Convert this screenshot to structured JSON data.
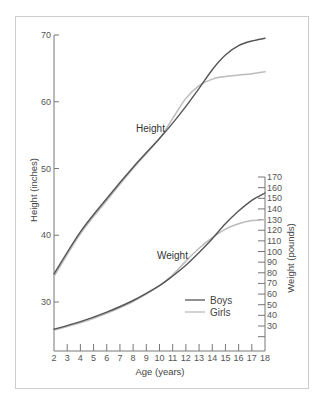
{
  "chart_data": {
    "type": "line",
    "title": "",
    "xlabel": "Age (years)",
    "ylabel_left": "Height (inches)",
    "ylabel_right": "Weight (pounds)",
    "xlim": [
      2,
      18
    ],
    "ylim_left": [
      22,
      70
    ],
    "ylim_right": [
      20,
      170
    ],
    "x_ticks": [
      2,
      3,
      4,
      5,
      6,
      7,
      8,
      9,
      10,
      11,
      12,
      13,
      14,
      15,
      16,
      17,
      18
    ],
    "left_ticks": [
      30,
      40,
      50,
      60,
      70
    ],
    "right_ticks": [
      30,
      40,
      50,
      60,
      70,
      80,
      90,
      100,
      110,
      120,
      130,
      140,
      150,
      160,
      170
    ],
    "right_minor_ticks": [
      20
    ],
    "annotations": {
      "height": "Height",
      "weight": "Weight"
    },
    "legend": {
      "position": "bottom-right",
      "entries": [
        {
          "name": "Boys",
          "color": "#555555"
        },
        {
          "name": "Girls",
          "color": "#bbbbbb"
        }
      ]
    },
    "grid": false,
    "series": [
      {
        "name": "Boys",
        "measure": "height",
        "axis": "left",
        "color": "#555555",
        "x": [
          2,
          4,
          6,
          8,
          10,
          11,
          12,
          13,
          14,
          15,
          16,
          17,
          18
        ],
        "values": [
          34.2,
          40.5,
          45.5,
          50.2,
          54.5,
          56.8,
          59.3,
          62.0,
          64.8,
          67.0,
          68.4,
          69.1,
          69.5
        ]
      },
      {
        "name": "Girls",
        "measure": "height",
        "axis": "left",
        "color": "#bbbbbb",
        "x": [
          2,
          4,
          6,
          8,
          10,
          11,
          12,
          13,
          14,
          15,
          16,
          17,
          18
        ],
        "values": [
          33.8,
          40.2,
          45.2,
          50.0,
          54.5,
          57.5,
          60.5,
          62.4,
          63.4,
          63.8,
          64.0,
          64.2,
          64.5
        ]
      },
      {
        "name": "Boys",
        "measure": "weight",
        "axis": "right",
        "color": "#555555",
        "x": [
          2,
          4,
          6,
          8,
          10,
          11,
          12,
          13,
          14,
          15,
          16,
          17,
          18
        ],
        "values": [
          27,
          34,
          43,
          54,
          68,
          77,
          87,
          99,
          112,
          126,
          138,
          148,
          155
        ]
      },
      {
        "name": "Girls",
        "measure": "weight",
        "axis": "right",
        "color": "#bbbbbb",
        "x": [
          2,
          4,
          6,
          8,
          10,
          11,
          12,
          13,
          14,
          15,
          16,
          17,
          18
        ],
        "values": [
          26,
          33,
          42,
          53,
          68,
          78,
          91,
          103,
          113,
          121,
          126,
          129,
          130
        ]
      }
    ]
  }
}
